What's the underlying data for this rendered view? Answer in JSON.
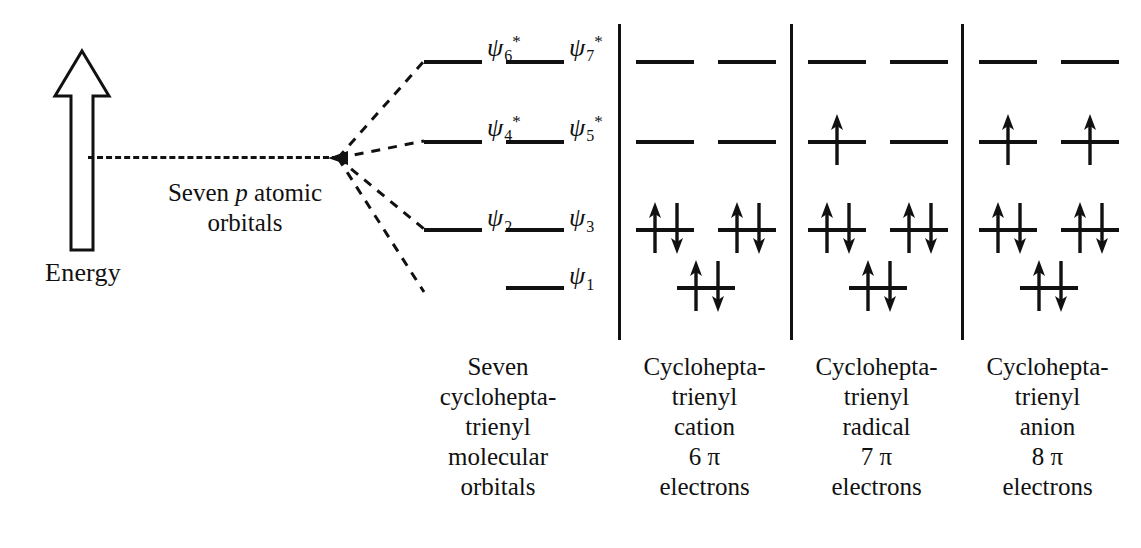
{
  "axis": {
    "label": "Energy",
    "arrow_direction": "up"
  },
  "atomic_orbitals": {
    "caption_line1_prefix": "Seven ",
    "caption_line1_italic": "p",
    "caption_line1_suffix": " atomic",
    "caption_line2": "orbitals"
  },
  "mo_levels": [
    {
      "id": "psi6",
      "symbol": "ψ",
      "subscript": "6",
      "star": "*",
      "row": 0,
      "side": "left"
    },
    {
      "id": "psi7",
      "symbol": "ψ",
      "subscript": "7",
      "star": "*",
      "row": 0,
      "side": "right"
    },
    {
      "id": "psi4",
      "symbol": "ψ",
      "subscript": "4",
      "star": "*",
      "row": 1,
      "side": "left"
    },
    {
      "id": "psi5",
      "symbol": "ψ",
      "subscript": "5",
      "star": "*",
      "row": 1,
      "side": "right"
    },
    {
      "id": "psi2",
      "symbol": "ψ",
      "subscript": "2",
      "star": "",
      "row": 2,
      "side": "left"
    },
    {
      "id": "psi3",
      "symbol": "ψ",
      "subscript": "3",
      "star": "",
      "row": 2,
      "side": "right"
    },
    {
      "id": "psi1",
      "symbol": "ψ",
      "subscript": "1",
      "star": "",
      "row": 3,
      "side": "center"
    }
  ],
  "mo_caption": {
    "line1": "Seven",
    "line2": "cyclohepta-",
    "line3": "trienyl",
    "line4": "molecular",
    "line5": "orbitals"
  },
  "species": [
    {
      "id": "cation",
      "line1": "Cyclohepta-",
      "line2": "trienyl",
      "line3": "cation",
      "line4": "6 π",
      "line5": "electrons",
      "pi_electrons": 6,
      "occupancy": {
        "row0_left": "",
        "row0_right": "",
        "row1_left": "",
        "row1_right": "",
        "row2_left": "updown",
        "row2_right": "updown",
        "row3_center": "updown"
      }
    },
    {
      "id": "radical",
      "line1": "Cyclohepta-",
      "line2": "trienyl",
      "line3": "radical",
      "line4": "7 π",
      "line5": "electrons",
      "pi_electrons": 7,
      "occupancy": {
        "row0_left": "",
        "row0_right": "",
        "row1_left": "up",
        "row1_right": "",
        "row2_left": "updown",
        "row2_right": "updown",
        "row3_center": "updown"
      }
    },
    {
      "id": "anion",
      "line1": "Cyclohepta-",
      "line2": "trienyl",
      "line3": "anion",
      "line4": "8 π",
      "line5": "electrons",
      "pi_electrons": 8,
      "occupancy": {
        "row0_left": "",
        "row0_right": "",
        "row1_left": "up",
        "row1_right": "up",
        "row2_left": "updown",
        "row2_right": "updown",
        "row3_center": "updown"
      }
    }
  ],
  "colors": {
    "ink": "#111111",
    "background": "#ffffff"
  },
  "chart_data": {
    "type": "diagram",
    "ylabel": "Energy",
    "level_rows_y": [
      60,
      140,
      228,
      286
    ],
    "levels": [
      "ψ1",
      "ψ2",
      "ψ3",
      "ψ4*",
      "ψ5*",
      "ψ6*",
      "ψ7*"
    ],
    "degeneracies": [
      1,
      2,
      2,
      2
    ],
    "series": [
      {
        "name": "Cycloheptatrienyl cation",
        "values": [
          2,
          2,
          2,
          0,
          0,
          0,
          0
        ]
      },
      {
        "name": "Cycloheptatrienyl radical",
        "values": [
          2,
          2,
          2,
          1,
          0,
          0,
          0
        ]
      },
      {
        "name": "Cycloheptatrienyl anion",
        "values": [
          2,
          2,
          2,
          1,
          1,
          0,
          0
        ]
      }
    ]
  }
}
